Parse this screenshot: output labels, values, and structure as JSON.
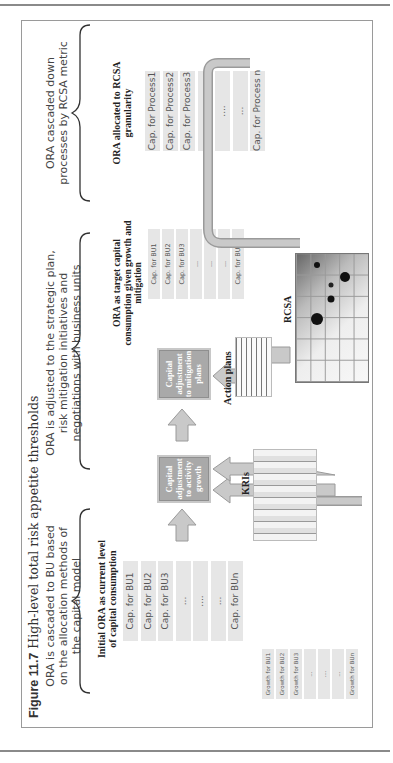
{
  "page": {
    "figure_number": "Figure 11.7",
    "figure_title": "High-level total risk appetite thresholds"
  },
  "stages": [
    {
      "description": "ORA is cascaded to BU based on the allocation methods of the capital model",
      "heading": "Initial ORA as current level of capital consumption",
      "cells": [
        "Cap. for BU1",
        "Cap. for BU2",
        "Cap. for BU3",
        "...",
        "....",
        "...",
        "Cap. for BUn"
      ]
    },
    {
      "description": "ORA is adjusted to the strategic plan, risk mitigation initiatives and negotiations with business units",
      "heading": "ORA as target capital consumption given growth and mitigation",
      "cells": [
        "Cap. for BU1",
        "Cap. for BU2",
        "Cap. for BU3",
        "...",
        "...",
        "...",
        "Cap. for BUn"
      ]
    },
    {
      "description": "ORA cascaded down processes by RCSA metric",
      "heading": "ORA allocated to RCSA granularity",
      "cells": [
        "Cap. for Process1",
        "Cap. for Process2",
        "Cap. for Process3",
        "...",
        "....",
        "...",
        "Cap. for Process n"
      ]
    }
  ],
  "process_boxes": {
    "activity": "Capital adjustment to activity growth",
    "mitigation": "Capital adjustment to mitigation plans"
  },
  "inputs": {
    "growth_cells": [
      "Growth for BU1",
      "Growth for BU2",
      "Growth for BU3",
      "...",
      "....",
      "...",
      "Growth for BUn"
    ],
    "kris_label": "KRIs",
    "action_plans_label": "Action plans",
    "rcsa_label": "RCSA"
  },
  "colors": {
    "arrow_fill": "#c9c9c9",
    "arrow_stroke": "#9a9a9a",
    "box_fill": "#a9a9a9",
    "cell_fill": "#e6e6e6"
  }
}
